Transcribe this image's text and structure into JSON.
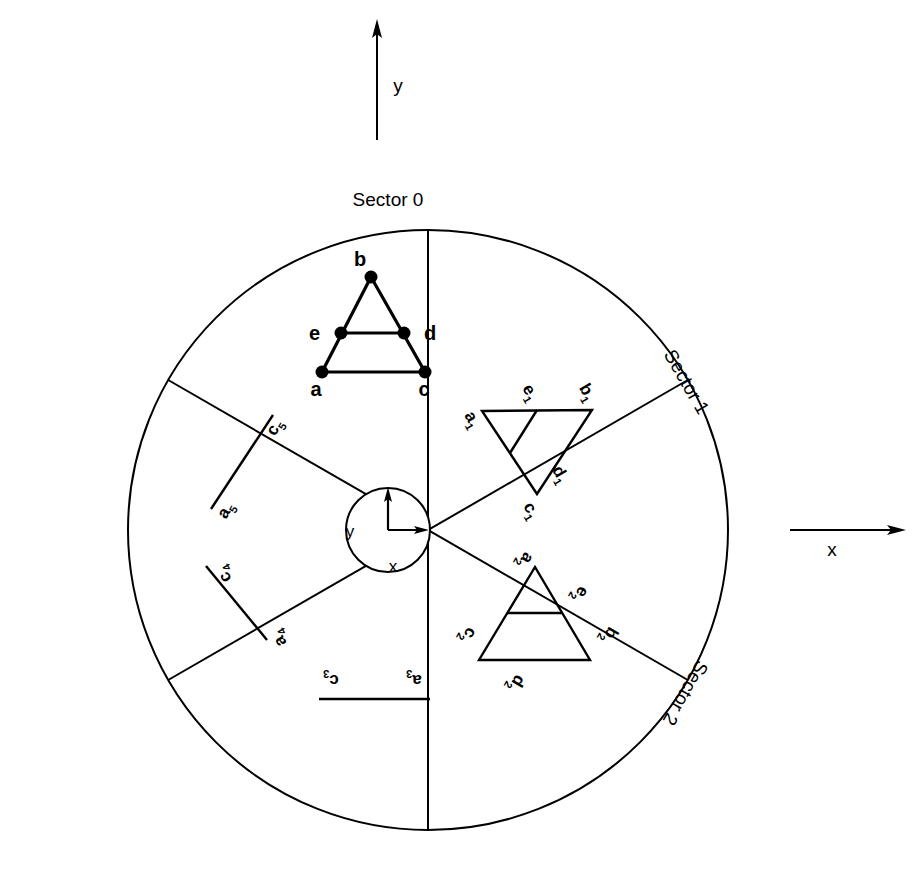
{
  "figure": {
    "background": "#ffffff",
    "ink": "#000000",
    "width": 917,
    "height": 879
  },
  "global_axes": {
    "y_label": "y",
    "x_label": "x",
    "y_axis": {
      "x": 377,
      "y_tail": 140,
      "y_head": 22,
      "label_x": 398,
      "label_y": 92
    },
    "x_axis": {
      "y": 530,
      "x_tail": 790,
      "x_head": 905,
      "label_x": 832,
      "label_y": 556
    }
  },
  "hub": {
    "center_x": 388,
    "center_y": 530,
    "radius": 42,
    "y_label": "y",
    "x_label": "x",
    "y_label_x": 350,
    "y_label_y": 537,
    "x_label_x": 393,
    "x_label_y": 572,
    "axis_origin_x": 388,
    "axis_origin_y": 530,
    "axis_y_top": 487,
    "axis_x_right": 428
  },
  "wheel": {
    "center_x": 428,
    "center_y": 530,
    "radius": 300,
    "spoke_count": 6,
    "spoke_angles_deg": [
      0,
      60,
      120,
      180,
      240,
      300
    ]
  },
  "sector_labels": [
    {
      "id": "sector-0",
      "text": "Sector 0",
      "x": 388,
      "y": 206,
      "rotate": 0
    },
    {
      "id": "sector-1",
      "text": "Sector 1",
      "x": 681,
      "y": 385,
      "rotate": 60
    },
    {
      "id": "sector-2",
      "text": "Sector 2",
      "x": 680,
      "y": 690,
      "rotate": 120
    }
  ],
  "shapes": {
    "sector0": {
      "name": "triangle-sector-0",
      "rotation_deg": 0,
      "outline": [
        [
          371,
          277
        ],
        [
          322,
          372
        ],
        [
          425,
          372
        ]
      ],
      "midline": [
        [
          341,
          333
        ],
        [
          404,
          333
        ]
      ],
      "vertices": [
        {
          "id": "a",
          "label": "a",
          "x": 322,
          "y": 372,
          "label_x": 316,
          "label_y": 396,
          "anchor": "middle"
        },
        {
          "id": "b",
          "label": "b",
          "x": 371,
          "y": 277,
          "label_x": 360,
          "label_y": 266,
          "anchor": "middle"
        },
        {
          "id": "c",
          "label": "c",
          "x": 425,
          "y": 372,
          "label_x": 424,
          "label_y": 396,
          "anchor": "middle"
        },
        {
          "id": "d",
          "label": "d",
          "x": 404,
          "y": 333,
          "label_x": 424,
          "label_y": 340,
          "anchor": "start"
        },
        {
          "id": "e",
          "label": "e",
          "x": 341,
          "y": 333,
          "label_x": 320,
          "label_y": 340,
          "anchor": "end"
        }
      ],
      "dots": true
    },
    "sector1": {
      "name": "triangle-sector-1",
      "rotation_deg": 60,
      "outline": [
        [
          482,
          411
        ],
        [
          592,
          410
        ],
        [
          537,
          494
        ]
      ],
      "midline": [
        [
          537,
          410
        ],
        [
          510,
          453
        ]
      ],
      "labels": [
        {
          "id": "a1",
          "text": "a",
          "sub": "1",
          "x": 468,
          "y": 422,
          "rotate": 60
        },
        {
          "id": "b1",
          "text": "b",
          "sub": "1",
          "x": 583,
          "y": 395,
          "rotate": 60
        },
        {
          "id": "c1",
          "text": "c",
          "sub": "1",
          "x": 527,
          "y": 513,
          "rotate": 60
        },
        {
          "id": "d1",
          "text": "d",
          "sub": "1",
          "x": 556,
          "y": 477,
          "rotate": 60
        },
        {
          "id": "e1",
          "text": "e",
          "sub": "1",
          "x": 526,
          "y": 395,
          "rotate": 60
        }
      ],
      "dots": false
    },
    "sector2": {
      "name": "triangle-sector-2",
      "rotation_deg": 120,
      "outline": [
        [
          535,
          567
        ],
        [
          479,
          660
        ],
        [
          590,
          660
        ]
      ],
      "midline": [
        [
          507,
          613
        ],
        [
          562,
          613
        ]
      ],
      "labels": [
        {
          "id": "a2",
          "text": "a",
          "sub": "2",
          "x": 521,
          "y": 558,
          "rotate": 120
        },
        {
          "id": "b2",
          "text": "b",
          "sub": "2",
          "x": 605,
          "y": 633,
          "rotate": 120
        },
        {
          "id": "c2",
          "text": "c",
          "sub": "2",
          "x": 464,
          "y": 633,
          "rotate": 120
        },
        {
          "id": "d2",
          "text": "d",
          "sub": "2",
          "x": 512,
          "y": 681,
          "rotate": 120
        },
        {
          "id": "e2",
          "text": "e",
          "sub": "2",
          "x": 576,
          "y": 592,
          "rotate": 120
        }
      ],
      "dots": false
    },
    "sector3": {
      "name": "segment-sector-3",
      "rotation_deg": 180,
      "segment": [
        [
          319,
          699
        ],
        [
          430,
          699
        ]
      ],
      "labels": [
        {
          "id": "a3",
          "text": "a",
          "sub": "3",
          "x": 414,
          "y": 675,
          "rotate": 180
        },
        {
          "id": "c3",
          "text": "c",
          "sub": "3",
          "x": 331,
          "y": 675,
          "rotate": 180
        }
      ]
    },
    "sector4": {
      "name": "segment-sector-4",
      "rotation_deg": 240,
      "segment": [
        [
          206,
          566
        ],
        [
          267,
          640
        ]
      ],
      "labels": [
        {
          "id": "a4",
          "text": "a",
          "sub": "4",
          "x": 283,
          "y": 636,
          "rotate": 240
        },
        {
          "id": "c4",
          "text": "c",
          "sub": "4",
          "x": 228,
          "y": 572,
          "rotate": 240
        }
      ]
    },
    "sector5": {
      "name": "segment-sector-5",
      "rotation_deg": 300,
      "segment": [
        [
          211,
          509
        ],
        [
          273,
          415
        ]
      ],
      "labels": [
        {
          "id": "a5",
          "text": "a",
          "sub": "5",
          "x": 230,
          "y": 513,
          "rotate": 300
        },
        {
          "id": "c5",
          "text": "c",
          "sub": "5",
          "x": 279,
          "y": 430,
          "rotate": 300
        }
      ]
    }
  }
}
